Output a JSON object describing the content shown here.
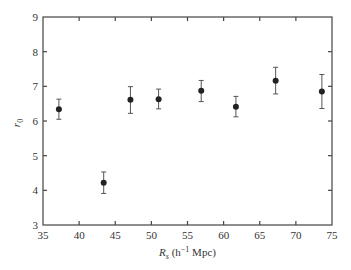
{
  "chart_data": {
    "type": "scatter",
    "title": "",
    "xlabel": "R_s (h^-1 Mpc)",
    "xlabel_parts": {
      "main": "R",
      "sub": "s",
      "open": " (h",
      "sup": "−1",
      "close": " Mpc)"
    },
    "ylabel": "r_0",
    "ylabel_parts": {
      "main": "r",
      "sub": "0"
    },
    "xlim": [
      35,
      75
    ],
    "ylim": [
      3,
      9
    ],
    "xticks": [
      35,
      40,
      45,
      50,
      55,
      60,
      65,
      70,
      75
    ],
    "yticks": [
      3,
      4,
      5,
      6,
      7,
      8,
      9
    ],
    "grid": false,
    "legend": null,
    "series": [
      {
        "name": "r0 vs Rs",
        "marker": "filled-circle",
        "color": "#222222",
        "points": [
          {
            "x": 37.2,
            "y": 6.34,
            "err_low": 6.05,
            "err_high": 6.63
          },
          {
            "x": 43.4,
            "y": 4.22,
            "err_low": 3.91,
            "err_high": 4.53
          },
          {
            "x": 47.1,
            "y": 6.61,
            "err_low": 6.22,
            "err_high": 6.99
          },
          {
            "x": 51.0,
            "y": 6.63,
            "err_low": 6.35,
            "err_high": 6.92
          },
          {
            "x": 56.9,
            "y": 6.87,
            "err_low": 6.56,
            "err_high": 7.17
          },
          {
            "x": 61.7,
            "y": 6.41,
            "err_low": 6.12,
            "err_high": 6.71
          },
          {
            "x": 67.2,
            "y": 7.16,
            "err_low": 6.78,
            "err_high": 7.55
          },
          {
            "x": 73.6,
            "y": 6.85,
            "err_low": 6.36,
            "err_high": 7.34
          }
        ]
      }
    ]
  },
  "style": {
    "axis_color": "#444444",
    "marker_color": "#222222",
    "errorbar_color": "#555555"
  }
}
